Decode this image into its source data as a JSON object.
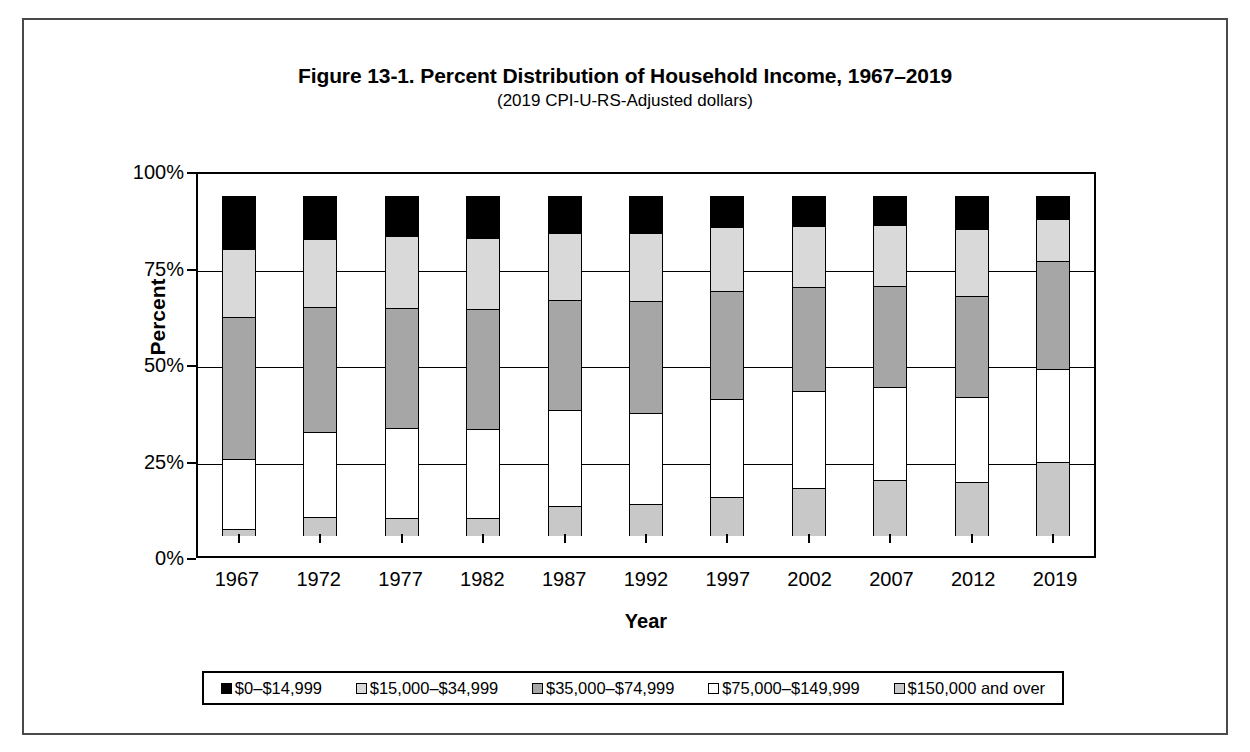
{
  "figure": {
    "title": "Figure 13-1. Percent Distribution of Household Income, 1967–2019",
    "subtitle": "(2019 CPI-U-RS-Adjusted dollars)"
  },
  "axes": {
    "y_title": "Percent",
    "x_title": "Year",
    "y_ticks": [
      "100%",
      "75%",
      "50%",
      "25%",
      "0%"
    ],
    "x_ticks": [
      "1967",
      "1972",
      "1977",
      "1982",
      "1987",
      "1992",
      "1997",
      "2002",
      "2007",
      "2012",
      "2019"
    ]
  },
  "legend": {
    "items": [
      {
        "label": "$0–$14,999",
        "color": "#000000"
      },
      {
        "label": "$15,000–$34,999",
        "color": "#d9d9d9"
      },
      {
        "label": "$35,000–$74,999",
        "color": "#a6a6a6"
      },
      {
        "label": "$75,000–$149,999",
        "color": "#ffffff"
      },
      {
        "label": "$150,000 and over",
        "color": "#c8c8c8"
      }
    ]
  },
  "chart_data": {
    "type": "bar",
    "stacked": true,
    "title": "Figure 13-1. Percent Distribution of Household Income, 1967–2019",
    "subtitle": "(2019 CPI-U-RS-Adjusted dollars)",
    "xlabel": "Year",
    "ylabel": "Percent",
    "ylim": [
      0,
      100
    ],
    "yticks": [
      0,
      25,
      50,
      75,
      100
    ],
    "grid": true,
    "legend_position": "bottom",
    "categories": [
      "1967",
      "1972",
      "1977",
      "1982",
      "1987",
      "1992",
      "1997",
      "2002",
      "2007",
      "2012",
      "2019"
    ],
    "series": [
      {
        "name": "$0–$14,999",
        "color": "#000000",
        "values": [
          15.3,
          12.6,
          11.6,
          12.3,
          10.8,
          10.8,
          9.0,
          8.6,
          8.3,
          9.6,
          6.6
        ]
      },
      {
        "name": "$15,000–$34,999",
        "color": "#d9d9d9",
        "values": [
          20.3,
          20.1,
          21.3,
          21.0,
          19.7,
          20.0,
          18.9,
          18.3,
          18.2,
          19.9,
          12.6
        ]
      },
      {
        "name": "$35,000–$74,999",
        "color": "#a6a6a6",
        "values": [
          41.8,
          36.8,
          35.4,
          35.4,
          32.7,
          33.1,
          31.9,
          30.6,
          29.8,
          29.7,
          32.0
        ]
      },
      {
        "name": "$75,000–$149,999",
        "color": "#ffffff",
        "values": [
          20.7,
          25.1,
          26.7,
          26.2,
          28.1,
          27.0,
          28.9,
          28.6,
          27.6,
          25.2,
          27.4
        ]
      },
      {
        "name": "$150,000 and over",
        "color": "#c8c8c8",
        "values": [
          1.9,
          5.4,
          5.0,
          5.1,
          8.7,
          9.1,
          11.3,
          13.9,
          16.1,
          15.6,
          21.4
        ]
      }
    ]
  }
}
